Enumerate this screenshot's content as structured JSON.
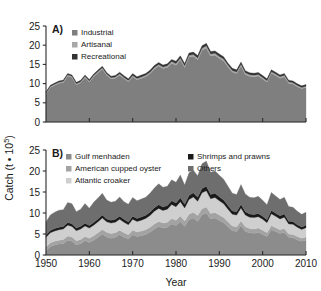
{
  "figure": {
    "axis_y_title": "Catch (t • 10",
    "axis_y_title_exp": "5",
    "axis_y_title_close": ")",
    "axis_x_title": "Year"
  },
  "colors": {
    "industrial": "#7f7f7f",
    "artisanal": "#a8a8a8",
    "recreational": "#333333",
    "gulf_menhaden": "#8c8c8c",
    "american_cupped_oyster": "#a3a3a3",
    "atlantic_croaker": "#cfcfcf",
    "shrimps_and_prawns": "#1a1a1a",
    "others": "#6e6e6e",
    "axis": "#2b2b2b",
    "text": "#1a1a1a",
    "background": "#ffffff"
  },
  "chart_data": [
    {
      "type": "area",
      "panel": "A)",
      "title": "",
      "xlabel": "Year",
      "ylabel": "Catch (t • 10^5)",
      "stacked": true,
      "grid": false,
      "legend_position": "top-left",
      "xlim": [
        1950,
        2010
      ],
      "ylim": [
        0,
        25
      ],
      "yticks": [
        0,
        5,
        10,
        15,
        20,
        25
      ],
      "xticks": [
        1950,
        1960,
        1970,
        1980,
        1990,
        2000,
        2010
      ],
      "x": [
        1950,
        1951,
        1952,
        1953,
        1954,
        1955,
        1956,
        1957,
        1958,
        1959,
        1960,
        1961,
        1962,
        1963,
        1964,
        1965,
        1966,
        1967,
        1968,
        1969,
        1970,
        1971,
        1972,
        1973,
        1974,
        1975,
        1976,
        1977,
        1978,
        1979,
        1980,
        1981,
        1982,
        1983,
        1984,
        1985,
        1986,
        1987,
        1988,
        1989,
        1990,
        1991,
        1992,
        1993,
        1994,
        1995,
        1996,
        1997,
        1998,
        1999,
        2000,
        2001,
        2002,
        2003,
        2004,
        2005,
        2006,
        2007,
        2008,
        2009,
        2010
      ],
      "series": [
        {
          "name": "Industrial",
          "color": "#7f7f7f",
          "values": [
            7.3,
            9.0,
            9.6,
            10.1,
            10.3,
            12.0,
            11.6,
            9.7,
            10.2,
            11.6,
            10.4,
            11.8,
            12.8,
            13.8,
            12.2,
            11.2,
            11.4,
            12.2,
            11.3,
            10.5,
            11.8,
            11.0,
            11.4,
            11.8,
            12.6,
            13.8,
            14.6,
            13.9,
            14.2,
            15.3,
            14.8,
            16.2,
            14.2,
            16.9,
            17.1,
            16.2,
            18.7,
            19.3,
            17.2,
            17.4,
            16.6,
            15.9,
            14.3,
            13.0,
            12.6,
            14.6,
            12.4,
            11.9,
            11.8,
            12.0,
            11.2,
            10.4,
            12.7,
            12.1,
            11.4,
            11.8,
            10.1,
            9.9,
            9.2,
            8.7,
            9.0
          ]
        },
        {
          "name": "Artisanal",
          "color": "#a8a8a8",
          "values": [
            0.25,
            0.25,
            0.25,
            0.28,
            0.28,
            0.3,
            0.3,
            0.28,
            0.3,
            0.3,
            0.3,
            0.32,
            0.32,
            0.34,
            0.32,
            0.32,
            0.32,
            0.34,
            0.32,
            0.32,
            0.34,
            0.34,
            0.34,
            0.36,
            0.38,
            0.4,
            0.4,
            0.4,
            0.42,
            0.44,
            0.44,
            0.46,
            0.44,
            0.48,
            0.5,
            0.48,
            0.52,
            0.54,
            0.5,
            0.5,
            0.48,
            0.48,
            0.45,
            0.42,
            0.42,
            0.45,
            0.42,
            0.4,
            0.4,
            0.4,
            0.38,
            0.36,
            0.4,
            0.4,
            0.38,
            0.38,
            0.35,
            0.35,
            0.32,
            0.3,
            0.32
          ]
        },
        {
          "name": "Recreational",
          "color": "#333333",
          "values": [
            0.3,
            0.3,
            0.32,
            0.32,
            0.34,
            0.34,
            0.34,
            0.34,
            0.36,
            0.36,
            0.38,
            0.38,
            0.4,
            0.4,
            0.4,
            0.42,
            0.42,
            0.44,
            0.44,
            0.44,
            0.46,
            0.46,
            0.48,
            0.48,
            0.5,
            0.52,
            0.52,
            0.54,
            0.54,
            0.56,
            0.58,
            0.58,
            0.6,
            0.6,
            0.62,
            0.62,
            0.64,
            0.64,
            0.64,
            0.62,
            0.62,
            0.6,
            0.58,
            0.58,
            0.56,
            0.56,
            0.54,
            0.54,
            0.52,
            0.52,
            0.5,
            0.5,
            0.5,
            0.48,
            0.48,
            0.46,
            0.44,
            0.44,
            0.42,
            0.42,
            0.42
          ]
        }
      ],
      "legend": [
        {
          "label": "Industrial",
          "color": "#7f7f7f"
        },
        {
          "label": "Artisanal",
          "color": "#a8a8a8"
        },
        {
          "label": "Recreational",
          "color": "#333333"
        }
      ]
    },
    {
      "type": "area",
      "panel": "B)",
      "title": "",
      "xlabel": "Year",
      "ylabel": "Catch (t • 10^5)",
      "stacked": true,
      "grid": false,
      "legend_position": "top",
      "xlim": [
        1950,
        2010
      ],
      "ylim": [
        0,
        25
      ],
      "yticks": [
        0,
        5,
        10,
        15,
        20,
        25
      ],
      "xticks": [
        1950,
        1960,
        1970,
        1980,
        1990,
        2000,
        2010
      ],
      "x": [
        1950,
        1951,
        1952,
        1953,
        1954,
        1955,
        1956,
        1957,
        1958,
        1959,
        1960,
        1961,
        1962,
        1963,
        1964,
        1965,
        1966,
        1967,
        1968,
        1969,
        1970,
        1971,
        1972,
        1973,
        1974,
        1975,
        1976,
        1977,
        1978,
        1979,
        1980,
        1981,
        1982,
        1983,
        1984,
        1985,
        1986,
        1987,
        1988,
        1989,
        1990,
        1991,
        1992,
        1993,
        1994,
        1995,
        1996,
        1997,
        1998,
        1999,
        2000,
        2001,
        2002,
        2003,
        2004,
        2005,
        2006,
        2007,
        2008,
        2009,
        2010
      ],
      "series": [
        {
          "name": "Gulf menhaden",
          "color": "#8c8c8c",
          "values": [
            1.0,
            2.0,
            2.4,
            2.6,
            2.7,
            3.5,
            3.3,
            2.4,
            2.7,
            3.4,
            3.0,
            3.5,
            4.2,
            5.0,
            4.3,
            4.0,
            4.2,
            4.8,
            4.2,
            3.8,
            4.8,
            4.4,
            4.6,
            4.9,
            5.4,
            6.2,
            6.8,
            6.4,
            6.6,
            7.4,
            7.0,
            8.0,
            6.8,
            8.4,
            8.8,
            8.0,
            9.6,
            10.0,
            8.6,
            8.8,
            8.2,
            7.7,
            6.7,
            5.8,
            5.6,
            7.0,
            5.6,
            5.3,
            5.2,
            5.4,
            4.9,
            4.4,
            6.0,
            5.6,
            5.1,
            5.4,
            4.2,
            4.1,
            3.6,
            3.3,
            3.5
          ]
        },
        {
          "name": "American cupped oyster",
          "color": "#a3a3a3",
          "values": [
            0.9,
            0.9,
            0.9,
            0.9,
            1.0,
            1.0,
            1.0,
            1.0,
            1.0,
            1.0,
            1.0,
            1.1,
            1.1,
            1.1,
            1.1,
            1.1,
            1.1,
            1.1,
            1.1,
            1.0,
            1.1,
            1.1,
            1.1,
            1.1,
            1.2,
            1.2,
            1.2,
            1.2,
            1.2,
            1.3,
            1.3,
            1.3,
            1.3,
            1.3,
            1.4,
            1.4,
            1.4,
            1.4,
            1.3,
            1.3,
            1.3,
            1.2,
            1.2,
            1.1,
            1.1,
            1.1,
            1.1,
            1.0,
            1.0,
            1.0,
            1.0,
            0.9,
            1.0,
            0.9,
            0.9,
            0.9,
            0.8,
            0.8,
            0.8,
            0.7,
            0.8
          ]
        },
        {
          "name": "Atlantic croaker",
          "color": "#cfcfcf",
          "values": [
            2.3,
            2.4,
            2.4,
            2.5,
            2.5,
            2.6,
            2.5,
            2.4,
            2.5,
            2.5,
            2.4,
            2.5,
            2.6,
            2.7,
            2.5,
            2.5,
            2.5,
            2.6,
            2.5,
            2.4,
            2.6,
            2.5,
            2.6,
            2.7,
            2.8,
            3.0,
            3.1,
            3.0,
            3.1,
            3.3,
            3.2,
            3.4,
            3.1,
            3.5,
            3.6,
            3.4,
            3.8,
            3.9,
            3.5,
            3.6,
            3.4,
            3.3,
            3.0,
            2.8,
            2.8,
            3.1,
            2.8,
            2.7,
            2.7,
            2.7,
            2.6,
            2.4,
            2.8,
            2.7,
            2.6,
            2.7,
            2.4,
            2.4,
            2.2,
            2.1,
            2.2
          ]
        },
        {
          "name": "Shrimps and prawns",
          "color": "#1a1a1a",
          "values": [
            0.55,
            0.55,
            0.58,
            0.58,
            0.6,
            0.62,
            0.62,
            0.6,
            0.62,
            0.64,
            0.64,
            0.66,
            0.68,
            0.7,
            0.68,
            0.68,
            0.7,
            0.72,
            0.7,
            0.68,
            0.72,
            0.72,
            0.74,
            0.76,
            0.8,
            0.84,
            0.86,
            0.84,
            0.86,
            0.9,
            0.9,
            0.94,
            0.88,
            0.96,
            1.0,
            0.96,
            1.04,
            1.06,
            0.98,
            1.0,
            0.96,
            0.92,
            0.86,
            0.8,
            0.8,
            0.86,
            0.8,
            0.76,
            0.76,
            0.76,
            0.72,
            0.68,
            0.78,
            0.74,
            0.72,
            0.74,
            0.66,
            0.66,
            0.6,
            0.58,
            0.6
          ]
        },
        {
          "name": "Others",
          "color": "#6e6e6e",
          "values": [
            3.1,
            3.7,
            3.9,
            4.1,
            4.0,
            4.8,
            4.8,
            3.9,
            4.1,
            4.7,
            4.1,
            4.8,
            5.0,
            5.2,
            4.5,
            4.3,
            4.3,
            4.6,
            4.2,
            4.2,
            4.5,
            4.2,
            4.3,
            4.3,
            4.5,
            4.7,
            5.0,
            4.7,
            4.6,
            5.0,
            4.9,
            5.4,
            4.6,
            5.4,
            5.4,
            5.1,
            5.9,
            6.0,
            5.3,
            5.3,
            5.1,
            4.9,
            4.6,
            4.2,
            4.1,
            4.7,
            4.2,
            4.0,
            4.0,
            4.1,
            3.8,
            3.6,
            4.3,
            4.1,
            3.9,
            4.0,
            3.5,
            3.4,
            3.2,
            3.0,
            3.1
          ]
        }
      ],
      "legend": [
        {
          "label": "Gulf menhaden",
          "color": "#8c8c8c"
        },
        {
          "label": "American cupped oyster",
          "color": "#a3a3a3"
        },
        {
          "label": "Atlantic croaker",
          "color": "#cfcfcf"
        },
        {
          "label": "Shrimps and prawns",
          "color": "#1a1a1a"
        },
        {
          "label": "Others",
          "color": "#6e6e6e"
        }
      ]
    }
  ]
}
